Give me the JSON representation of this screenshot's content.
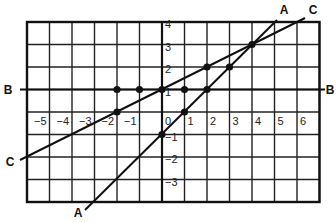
{
  "diagram": {
    "type": "coordinate-grid",
    "grid": {
      "x_range": [
        -6,
        7
      ],
      "y_range": [
        -4,
        4
      ],
      "x_tick_labels": [
        "−5",
        "−4",
        "−3",
        "−2",
        "−1",
        "0",
        "1",
        "2",
        "3",
        "4",
        "5",
        "6"
      ],
      "x_tick_values": [
        -5,
        -4,
        -3,
        -2,
        -1,
        0,
        1,
        2,
        3,
        4,
        5,
        6
      ],
      "y_tick_labels": [
        "4",
        "3",
        "2",
        "1",
        "0",
        "−1",
        "−2",
        "−3"
      ],
      "y_tick_values": [
        4,
        3,
        2,
        1,
        0,
        -1,
        -2,
        -3
      ]
    },
    "lines": [
      {
        "name": "A",
        "label_start": "A",
        "label_end": "A",
        "equation": "y = x - 1",
        "slope": 1,
        "intercept": -1
      },
      {
        "name": "B",
        "label_start": "B",
        "label_end": "B",
        "equation": "y = 1",
        "slope": 0,
        "intercept": 1
      },
      {
        "name": "C",
        "label_start": "C",
        "label_end": "C",
        "equation": "y = 0.5x + 1",
        "slope": 0.5,
        "intercept": 1
      }
    ],
    "points": [
      {
        "x": -2,
        "y": 1
      },
      {
        "x": -1,
        "y": 1
      },
      {
        "x": 0,
        "y": 1
      },
      {
        "x": 1,
        "y": 1
      },
      {
        "x": 2,
        "y": 1
      },
      {
        "x": -2,
        "y": 0
      },
      {
        "x": 0,
        "y": -1
      },
      {
        "x": 1,
        "y": 0
      },
      {
        "x": 2,
        "y": 2
      },
      {
        "x": 3,
        "y": 2
      },
      {
        "x": 4,
        "y": 3
      }
    ]
  }
}
